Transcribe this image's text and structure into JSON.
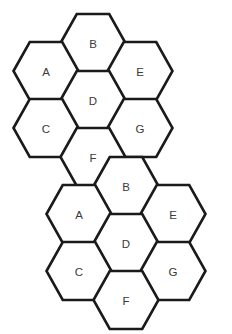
{
  "figure": {
    "background_color": "#ffffff",
    "stroke_color": "#1a1a1a",
    "fill_color": "#ffffff",
    "label_color": "#3a3a3a",
    "stroke_width": 2.6,
    "hex_orientation": "flat-top",
    "hex_width": 65,
    "hex_height": 58,
    "clusters": [
      {
        "name": "upper-cluster",
        "cells": [
          {
            "label": "B",
            "cx": 93,
            "cy": 43
          },
          {
            "label": "A",
            "cx": 46,
            "cy": 71
          },
          {
            "label": "E",
            "cx": 140,
            "cy": 71
          },
          {
            "label": "D",
            "cx": 93,
            "cy": 100
          },
          {
            "label": "C",
            "cx": 46,
            "cy": 128
          },
          {
            "label": "G",
            "cx": 140,
            "cy": 128
          },
          {
            "label": "F",
            "cx": 93,
            "cy": 157
          }
        ]
      },
      {
        "name": "lower-cluster",
        "cells": [
          {
            "label": "B",
            "cx": 126,
            "cy": 186
          },
          {
            "label": "A",
            "cx": 79,
            "cy": 214
          },
          {
            "label": "E",
            "cx": 173,
            "cy": 214
          },
          {
            "label": "D",
            "cx": 126,
            "cy": 243
          },
          {
            "label": "C",
            "cx": 79,
            "cy": 271
          },
          {
            "label": "G",
            "cx": 173,
            "cy": 271
          },
          {
            "label": "F",
            "cx": 126,
            "cy": 300
          }
        ]
      }
    ]
  }
}
